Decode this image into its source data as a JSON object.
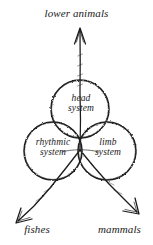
{
  "diagram": {
    "title_text": "",
    "background_color": "#ffffff",
    "ink_color": "#1a1a1a",
    "style": "hand-drawn-sketch",
    "outer_labels": [
      {
        "id": "lower-animals",
        "text": "lower animals",
        "position": "top"
      },
      {
        "id": "fishes",
        "text": "fishes",
        "position": "bottom-left"
      },
      {
        "id": "mammals",
        "text": "mammals",
        "position": "bottom-right"
      }
    ],
    "circles": [
      {
        "id": "head-system",
        "line1": "head",
        "line2": "system",
        "text": "head system",
        "cx": 80,
        "cy": 109,
        "r": 29
      },
      {
        "id": "rhythmic-system",
        "line1": "rhythmic",
        "line2": "system",
        "text": "rhythmic system",
        "cx": 53,
        "cy": 151,
        "r": 29
      },
      {
        "id": "limb-system",
        "line1": "limb",
        "line2": "system",
        "text": "limb system",
        "cx": 107,
        "cy": 151,
        "r": 29
      }
    ],
    "arrows": [
      {
        "id": "arrow-up",
        "points_to": "lower animals",
        "direction": "up"
      },
      {
        "id": "arrow-down-left",
        "points_to": "fishes",
        "direction": "down-left"
      },
      {
        "id": "arrow-down-right",
        "points_to": "mammals",
        "direction": "down-right"
      }
    ]
  }
}
